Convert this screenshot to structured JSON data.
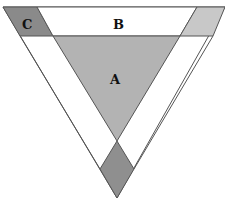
{
  "diagram": {
    "labels": {
      "a": "A",
      "b": "B",
      "c": "C"
    },
    "colors": {
      "region_a": "#b3b3b3",
      "region_b": "#ffffff",
      "region_c": "#8a8a8a",
      "right_corner": "#c8c8c8",
      "diamond": "#8f8f8f",
      "stroke": "#555555"
    }
  }
}
